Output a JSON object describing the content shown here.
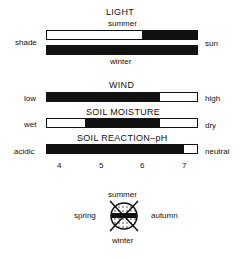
{
  "light": {
    "title": "LIGHT",
    "top_label": "summer",
    "bottom_label": "winter",
    "left_label": "shade",
    "right_label": "sun",
    "summer_bar": {
      "filled_from": 0.64,
      "filled_to": 1.0
    },
    "winter_bar": {
      "filled_from": 0.0,
      "filled_to": 1.0
    }
  },
  "wind": {
    "title": "WIND",
    "left_label": "low",
    "right_label": "high",
    "bar": {
      "filled_from": 0.0,
      "filled_to": 0.75
    }
  },
  "soil_moisture": {
    "title": "SOIL MOISTURE",
    "left_label": "wet",
    "right_label": "dry",
    "bar": {
      "filled_from": 0.25,
      "filled_to": 0.75
    }
  },
  "soil_reaction": {
    "title": "SOIL REACTION–pH",
    "left_label": "acidic",
    "right_label": "neutral",
    "bar": {
      "filled_from": 0.0,
      "filled_to": 0.92
    },
    "scale_ticks": [
      "4",
      "5",
      "6",
      "7"
    ]
  },
  "seasons": {
    "top": "summer",
    "bottom": "winter",
    "left": "spring",
    "right": "autumn"
  }
}
